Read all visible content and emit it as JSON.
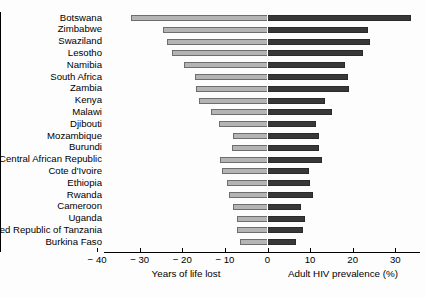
{
  "chart_data": {
    "type": "bar",
    "subtype": "diverging-horizontal-bar",
    "title": "",
    "subtitle": "",
    "categories": [
      "Botswana",
      "Zimbabwe",
      "Swaziland",
      "Lesotho",
      "Namibia",
      "South Africa",
      "Zambia",
      "Kenya",
      "Malawi",
      "Djibouti",
      "Mozambique",
      "Burundi",
      "Central African Republic",
      "Cote d'Ivoire",
      "Ethiopia",
      "Rwanda",
      "Cameroon",
      "Uganda",
      "United Republic of Tanzania",
      "Burkina Faso"
    ],
    "series": [
      {
        "name": "Years of life lost",
        "axis_title": "Years of life lost",
        "side": "left",
        "color": "#b4b4b4",
        "unit": "years",
        "values": [
          -32.0,
          -24.5,
          -23.5,
          -22.5,
          -19.5,
          -17.0,
          -16.8,
          -16.0,
          -13.3,
          -11.4,
          -8.1,
          -8.3,
          -11.2,
          -10.7,
          -9.5,
          -9.0,
          -8.1,
          -7.2,
          -7.2,
          -6.5
        ]
      },
      {
        "name": "Adult HIV prevalence (%)",
        "axis_title": "Adult HIV prevalence (%)",
        "side": "right",
        "color": "#383838",
        "unit": "%",
        "values": [
          33.8,
          23.6,
          24.1,
          22.4,
          18.2,
          18.9,
          19.1,
          13.5,
          15.2,
          11.4,
          12.1,
          12.1,
          12.8,
          9.8,
          10.0,
          10.7,
          7.8,
          8.8,
          8.4,
          6.7
        ]
      }
    ],
    "x_ticks": [
      -40,
      -30,
      -20,
      -10,
      0,
      10,
      20,
      30
    ],
    "x_tick_labels": [
      "− 40",
      "− 30",
      "− 20",
      "− 10",
      "0",
      "10",
      "20",
      "30"
    ],
    "xlim": [
      -44,
      38
    ],
    "grid": false,
    "legend": "none",
    "left_axis_label": "Years of life lost",
    "right_axis_label": "Adult HIV prevalence (%)"
  },
  "axis": {
    "left_title": "Years of life lost",
    "right_title": "Adult HIV prevalence (%)"
  }
}
